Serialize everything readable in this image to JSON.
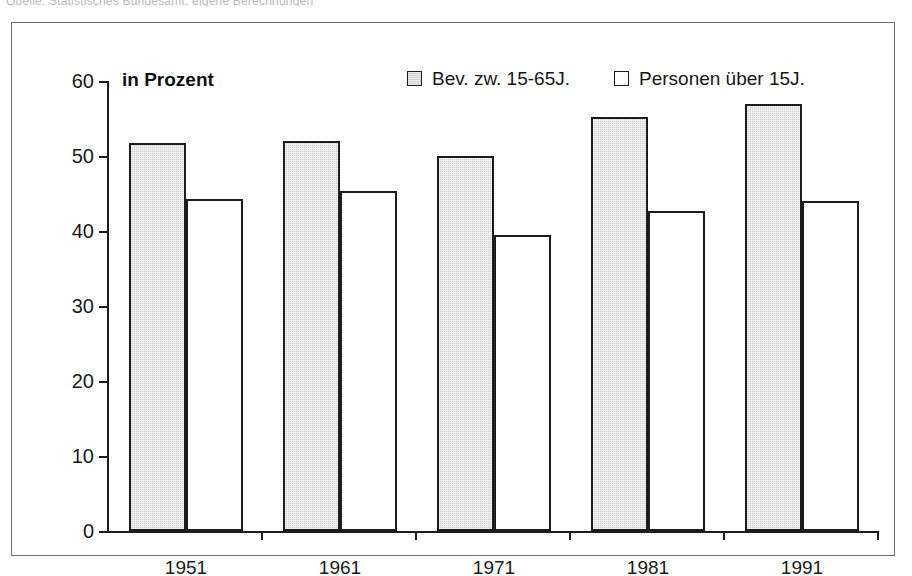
{
  "page": {
    "scan_header_text": "Quelle: Statistisches Bundesamt, eigene Berechnungen"
  },
  "chart_data": {
    "type": "bar",
    "title": "",
    "subtitle": "",
    "axis_title": "in Prozent",
    "xlabel": "",
    "ylabel": "in Prozent",
    "ylim": [
      0,
      60
    ],
    "ytick_step": 10,
    "yticks": [
      60,
      50,
      40,
      30,
      20,
      10,
      0
    ],
    "grid": false,
    "legend_position": "top-right",
    "categories": [
      "1951",
      "1961",
      "1971",
      "1981",
      "1991"
    ],
    "series": [
      {
        "name": "Bev. zw. 15-65J.",
        "color": "#d3d3d3",
        "values": [
          51.8,
          52.0,
          50.0,
          55.2,
          56.9
        ]
      },
      {
        "name": "Personen über 15J.",
        "color": "#ffffff",
        "values": [
          44.3,
          45.3,
          39.5,
          42.7,
          44.0
        ]
      }
    ],
    "legend": [
      {
        "label": "Bev. zw. 15-65J.",
        "swatch": "gray"
      },
      {
        "label": "Personen über 15J.",
        "swatch": "white"
      }
    ]
  },
  "style": {
    "frame_color": "#6e6e6e",
    "axis_color": "#1c1c1c",
    "bar_fill_a": "#d3d3d3",
    "bar_fill_b": "#ffffff",
    "text_color": "#1a1a1a"
  }
}
